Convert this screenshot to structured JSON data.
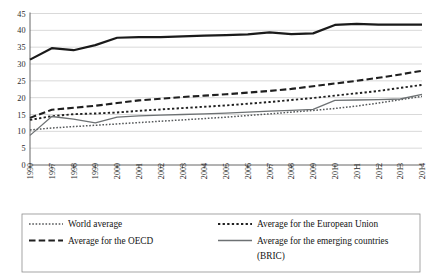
{
  "chart_data": {
    "type": "line",
    "title": "",
    "subtitle": "",
    "xlabel": "",
    "ylabel": "",
    "grid": "horizontal",
    "legend_position": "bottom",
    "ylim": [
      0,
      45
    ],
    "yticks": [
      0,
      5,
      10,
      15,
      20,
      25,
      30,
      35,
      40,
      45
    ],
    "ytick_labels": [
      "0",
      "5",
      "10",
      "15",
      "20",
      "25",
      "30",
      "35",
      "40",
      "45"
    ],
    "categories": [
      "1990",
      "1997",
      "1998",
      "1999",
      "2000",
      "2001",
      "2002",
      "2003",
      "2004",
      "2005",
      "2006",
      "2007",
      "2008",
      "2009",
      "2010",
      "2011",
      "2012",
      "2013",
      "2014"
    ],
    "series": [
      {
        "name": "World average",
        "style": "fine-dotted",
        "color": "#55585a",
        "width": 1.5,
        "dash": "1.6,1.7",
        "values": [
          10.4,
          11.0,
          11.4,
          11.8,
          12.2,
          12.6,
          13.0,
          13.4,
          13.8,
          14.2,
          14.7,
          15.2,
          15.7,
          16.2,
          16.8,
          17.5,
          18.4,
          19.4,
          20.4
        ]
      },
      {
        "name": "Average for the OECD",
        "style": "dashed",
        "color": "#1f1f1f",
        "width": 2.1,
        "dash": "6.5,3.2",
        "values": [
          14.0,
          16.4,
          17.0,
          17.6,
          18.4,
          19.2,
          19.7,
          20.2,
          20.6,
          21.0,
          21.5,
          22.0,
          22.6,
          23.4,
          24.2,
          25.0,
          25.9,
          26.9,
          28.0
        ]
      },
      {
        "name": "Average for Northern Europe",
        "style": "solid-thick",
        "color": "#1a1a1a",
        "width": 2.2,
        "dash": "",
        "values": [
          31.3,
          34.7,
          34.1,
          35.6,
          37.8,
          38.0,
          38.0,
          38.2,
          38.4,
          38.6,
          38.8,
          39.4,
          38.9,
          39.1,
          41.6,
          41.9,
          41.7,
          41.7,
          41.7
        ]
      },
      {
        "name": "Average for the European Union",
        "style": "coarse-dotted",
        "color": "#1f1f1f",
        "width": 1.9,
        "dash": "2.3,2.3",
        "values": [
          13.4,
          14.5,
          15.1,
          15.3,
          15.6,
          16.1,
          16.5,
          16.9,
          17.3,
          17.7,
          18.2,
          18.7,
          19.3,
          19.9,
          20.6,
          21.3,
          22.0,
          22.9,
          23.8
        ]
      },
      {
        "name": "Average for the emerging countries (BRIC)",
        "style": "solid-thin",
        "color": "#6d7173",
        "width": 1.3,
        "dash": "",
        "values": [
          8.8,
          14.4,
          13.6,
          12.5,
          14.2,
          14.6,
          14.8,
          15.0,
          15.2,
          15.4,
          15.7,
          16.0,
          16.2,
          16.5,
          19.2,
          19.3,
          19.4,
          19.6,
          21.0
        ]
      }
    ],
    "legend_entries": [
      {
        "label": "World average",
        "series": 0,
        "column": 0,
        "row": 0
      },
      {
        "label": "Average for the European Union",
        "series": 3,
        "column": 1,
        "row": 0
      },
      {
        "label": "Average for the OECD",
        "series": 1,
        "column": 0,
        "row": 1
      },
      {
        "label": "Average for the emerging countries",
        "series": 4,
        "column": 1,
        "row": 1
      },
      {
        "label": "(BRIC)",
        "series": -1,
        "column": 1,
        "row": 2
      }
    ]
  }
}
